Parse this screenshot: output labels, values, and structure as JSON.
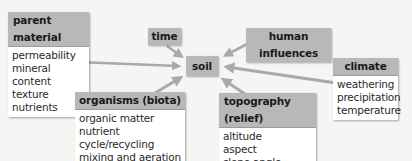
{
  "diagram": {
    "center": {
      "label": "soil"
    },
    "factors": [
      {
        "id": "parent_material",
        "title": "parent material",
        "items": [
          "permeability",
          "mineral content",
          "texture",
          "nutrients"
        ]
      },
      {
        "id": "time",
        "title": "time",
        "items": []
      },
      {
        "id": "human_influences",
        "title": "human influences",
        "items": []
      },
      {
        "id": "climate",
        "title": "climate",
        "items": [
          "weathering",
          "precipitation",
          "temperature"
        ]
      },
      {
        "id": "organisms",
        "title": "organisms (biota)",
        "items": [
          "organic matter",
          "nutrient cycle/recycling",
          "mixing and aeration"
        ]
      },
      {
        "id": "topography",
        "title": "topography (relief)",
        "items": [
          "altitude",
          "aspect",
          "slope angle"
        ]
      }
    ],
    "edges": [
      {
        "from": "parent_material",
        "to": "soil"
      },
      {
        "from": "time",
        "to": "soil"
      },
      {
        "from": "human_influences",
        "to": "soil"
      },
      {
        "from": "climate",
        "to": "soil"
      },
      {
        "from": "organisms",
        "to": "soil"
      },
      {
        "from": "topography",
        "to": "soil"
      }
    ],
    "colors": {
      "header": "#b8b8b8",
      "arrow": "#a9a9a9",
      "background": "#f5f5f4"
    }
  }
}
